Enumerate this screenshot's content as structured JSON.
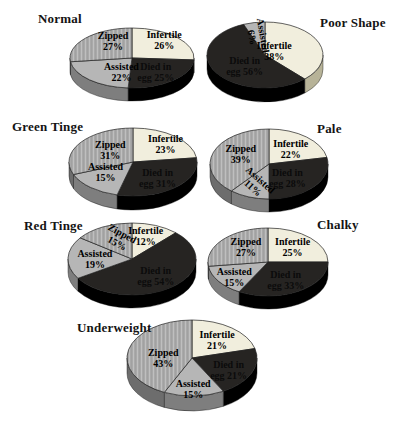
{
  "figure_title": "Egg condition pie charts",
  "palette": {
    "infertile": "#f1eedd",
    "zipped": "#a9a9a9",
    "zipped_hatch": "#bfbfbf",
    "assisted": "#b6b6b6",
    "died": "#262422",
    "side_infertile": "#b7b398",
    "side_zipped": "#6d6d6d",
    "side_assisted": "#7e7e7e",
    "side_died": "#000000",
    "outline": "#1f1f1f",
    "label_text": "#000000",
    "died_label_text": "#0b0b0b",
    "background": "#ffffff"
  },
  "chart_data": [
    {
      "type": "pie",
      "title": "Normal",
      "categories": [
        "Infertile",
        "Died in egg",
        "Assisted",
        "Zipped"
      ],
      "values": [
        26,
        25,
        22,
        27
      ],
      "slices": [
        {
          "label": "Infertile",
          "value": 26,
          "label_dx": 6,
          "label_dy": -7,
          "label_rot": 0
        },
        {
          "label": "Died in egg",
          "value": 25,
          "label_dx": 0,
          "label_dy": 0,
          "label_rot": 0
        },
        {
          "label": "Assisted",
          "value": 22,
          "label_dx": 14,
          "label_dy": 0,
          "label_rot": 0
        },
        {
          "label": "Zipped",
          "value": 27,
          "label_dx": 8,
          "label_dy": -6,
          "label_rot": 0
        }
      ],
      "layout": {
        "cx": 132,
        "cy": 58,
        "rx": 62,
        "ry": 30,
        "depth": 13,
        "title_x": 38,
        "title_y": 11
      }
    },
    {
      "type": "pie",
      "title": "Poor Shape",
      "categories": [
        "Infertile",
        "Died in egg",
        "Assisted"
      ],
      "values": [
        38,
        56,
        6
      ],
      "slices": [
        {
          "label": "Infertile",
          "value": 38,
          "label_dx": -22,
          "label_dy": 2,
          "label_rot": 0
        },
        {
          "label": "Died in egg",
          "value": 56,
          "label_dx": 8,
          "label_dy": 0,
          "label_rot": 0
        },
        {
          "label": "Assisted",
          "value": 6,
          "label_dx": 0,
          "label_dy": 0,
          "label_rot": 80
        }
      ],
      "layout": {
        "cx": 265,
        "cy": 55,
        "rx": 58,
        "ry": 33,
        "depth": 14,
        "title_x": 320,
        "title_y": 15
      }
    },
    {
      "type": "pie",
      "title": "Green Tinge",
      "categories": [
        "Infertile",
        "Died in egg",
        "Assisted",
        "Zipped"
      ],
      "values": [
        23,
        31,
        15,
        31
      ],
      "slices": [
        {
          "label": "Infertile",
          "value": 23,
          "label_dx": 8,
          "label_dy": -4,
          "label_rot": 0
        },
        {
          "label": "Died in egg",
          "value": 31,
          "label_dx": 0,
          "label_dy": 0,
          "label_rot": 0
        },
        {
          "label": "Assisted",
          "value": 15,
          "label_dx": -3,
          "label_dy": -6,
          "label_rot": 0
        },
        {
          "label": "Zipped",
          "value": 31,
          "label_dx": 8,
          "label_dy": -2,
          "label_rot": 0
        }
      ],
      "layout": {
        "cx": 133,
        "cy": 162,
        "rx": 64,
        "ry": 34,
        "depth": 14,
        "title_x": 12,
        "title_y": 119
      }
    },
    {
      "type": "pie",
      "title": "Pale",
      "categories": [
        "Infertile",
        "Died in egg",
        "Assisted",
        "Zipped"
      ],
      "values": [
        22,
        28,
        11,
        39
      ],
      "slices": [
        {
          "label": "Infertile",
          "value": 22,
          "label_dx": 0,
          "label_dy": 0,
          "label_rot": 0
        },
        {
          "label": "Died in egg",
          "value": 28,
          "label_dx": -8,
          "label_dy": 0,
          "label_rot": 0
        },
        {
          "label": "Assisted",
          "value": 11,
          "label_dx": 0,
          "label_dy": 0,
          "label_rot": 42
        },
        {
          "label": "Zipped",
          "value": 39,
          "label_dx": 4,
          "label_dy": -4,
          "label_rot": 0
        }
      ],
      "layout": {
        "cx": 269,
        "cy": 164,
        "rx": 59,
        "ry": 35,
        "depth": 13,
        "title_x": 317,
        "title_y": 121
      }
    },
    {
      "type": "pie",
      "title": "Red Tinge",
      "categories": [
        "Infertile",
        "Died in egg",
        "Assisted",
        "Zipped"
      ],
      "values": [
        12,
        54,
        19,
        15
      ],
      "slices": [
        {
          "label": "Infertile",
          "value": 12,
          "label_dx": 0,
          "label_dy": -5,
          "label_rot": 0
        },
        {
          "label": "Died in egg",
          "value": 54,
          "label_dx": 0,
          "label_dy": 0,
          "label_rot": 0
        },
        {
          "label": "Assisted",
          "value": 19,
          "label_dx": 0,
          "label_dy": 0,
          "label_rot": 0
        },
        {
          "label": "Zipped",
          "value": 15,
          "label_dx": 5,
          "label_dy": -3,
          "label_rot": 28
        }
      ],
      "layout": {
        "cx": 132,
        "cy": 259,
        "rx": 64,
        "ry": 36,
        "depth": 13,
        "title_x": 24,
        "title_y": 218
      }
    },
    {
      "type": "pie",
      "title": "Chalky",
      "categories": [
        "Infertile",
        "Died in egg",
        "Assisted",
        "Zipped"
      ],
      "values": [
        25,
        33,
        15,
        27
      ],
      "slices": [
        {
          "label": "Infertile",
          "value": 25,
          "label_dx": 0,
          "label_dy": -2,
          "label_rot": 0
        },
        {
          "label": "Died in egg",
          "value": 33,
          "label_dx": 0,
          "label_dy": 0,
          "label_rot": 0
        },
        {
          "label": "Assisted",
          "value": 15,
          "label_dx": -5,
          "label_dy": 3,
          "label_rot": 0
        },
        {
          "label": "Zipped",
          "value": 27,
          "label_dx": 4,
          "label_dy": -3,
          "label_rot": 0
        }
      ],
      "layout": {
        "cx": 268,
        "cy": 262,
        "rx": 60,
        "ry": 34,
        "depth": 13,
        "title_x": 317,
        "title_y": 217
      }
    },
    {
      "type": "pie",
      "title": "Underweight",
      "categories": [
        "Infertile",
        "Died in egg",
        "Assisted",
        "Zipped"
      ],
      "values": [
        21,
        21,
        15,
        43
      ],
      "slices": [
        {
          "label": "Infertile",
          "value": 21,
          "label_dx": 2,
          "label_dy": -2,
          "label_rot": 0
        },
        {
          "label": "Died in egg",
          "value": 21,
          "label_dx": 2,
          "label_dy": 2,
          "label_rot": 0
        },
        {
          "label": "Assisted",
          "value": 15,
          "label_dx": 0,
          "label_dy": 8,
          "label_rot": 0
        },
        {
          "label": "Zipped",
          "value": 43,
          "label_dx": 8,
          "label_dy": 4,
          "label_rot": 0
        }
      ],
      "layout": {
        "cx": 192,
        "cy": 358,
        "rx": 65,
        "ry": 38,
        "depth": 15,
        "title_x": 77,
        "title_y": 320
      }
    }
  ]
}
